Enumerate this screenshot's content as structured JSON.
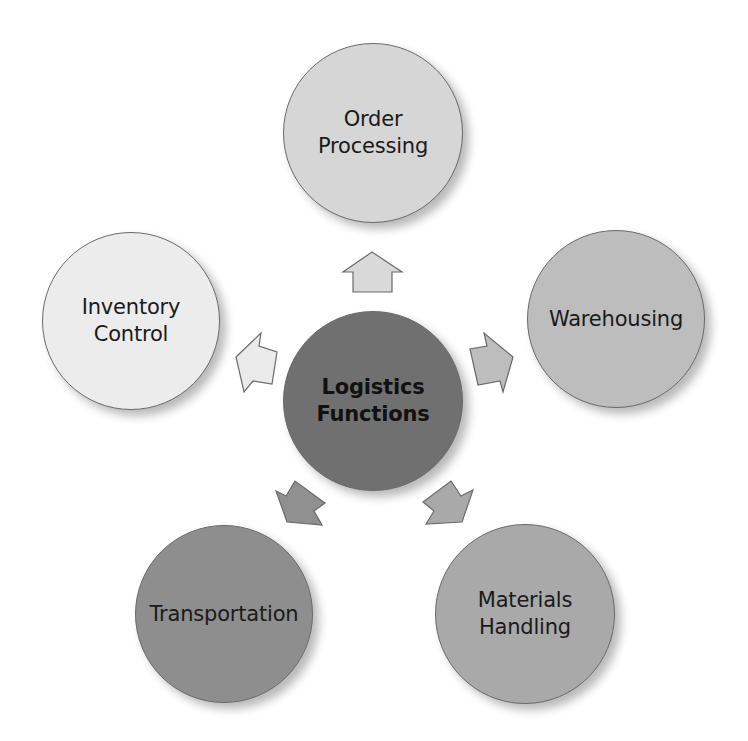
{
  "diagram": {
    "title": "Logistics Functions",
    "center": {
      "lines": [
        "Logistics",
        "Functions"
      ],
      "fill": "#707070",
      "cx": 373,
      "cy": 401,
      "r": 90
    },
    "nodes": [
      {
        "id": "order-processing",
        "lines": [
          "Order",
          "Processing"
        ],
        "fill": "#d6d6d6",
        "cx": 373,
        "cy": 133,
        "r": 90
      },
      {
        "id": "warehousing",
        "lines": [
          "Warehousing"
        ],
        "fill": "#bdbdbd",
        "cx": 616,
        "cy": 319,
        "r": 89
      },
      {
        "id": "materials-handling",
        "lines": [
          "Materials",
          "Handling"
        ],
        "fill": "#a9a9a9",
        "cx": 525,
        "cy": 614,
        "r": 90
      },
      {
        "id": "transportation",
        "lines": [
          "Transportation"
        ],
        "fill": "#8e8e8e",
        "cx": 224,
        "cy": 614,
        "r": 89
      },
      {
        "id": "inventory-control",
        "lines": [
          "Inventory",
          "Control"
        ],
        "fill": "#ececec",
        "cx": 131,
        "cy": 321,
        "r": 89
      }
    ],
    "arrows": [
      {
        "target": "order-processing",
        "fill": "#d9d9d9",
        "points": "372,252 402,272 392,272 392,292 353,292 353,272 343,272"
      },
      {
        "target": "warehousing",
        "fill": "#bdbdbd",
        "points": "513,357 503,392 500,381 478,385 470,349 487,346 484,333"
      },
      {
        "target": "materials-handling",
        "fill": "#a9a9a9",
        "points": "462,522 426,524 434,511 423,502 451,481 461,496 473,490"
      },
      {
        "target": "transportation",
        "fill": "#909090",
        "points": "287,522 322,525 314,511 325,503 295,481 286,496 276,491"
      },
      {
        "target": "inventory-control",
        "fill": "#eaeaea",
        "points": "236,357 261,333 259,346 277,352 272,384 253,381 244,392"
      }
    ]
  }
}
